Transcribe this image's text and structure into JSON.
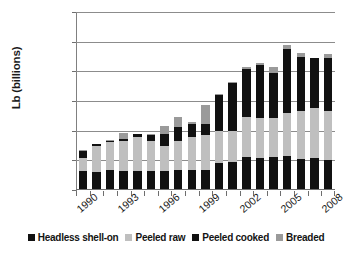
{
  "chart_data": {
    "type": "bar",
    "stacked": true,
    "title": "",
    "xlabel": "",
    "ylabel": "Lb (billions)",
    "ylim": [
      0,
      3
    ],
    "ytick_labels": [
      "0",
      "0.5",
      "1",
      "1.5",
      "2",
      "2.5",
      "3"
    ],
    "ytick_values": [
      0,
      0.5,
      1,
      1.5,
      2,
      2.5,
      3
    ],
    "grid": true,
    "legend_position": "bottom",
    "categories": [
      1990,
      1991,
      1992,
      1993,
      1994,
      1995,
      1996,
      1997,
      1998,
      1999,
      2000,
      2001,
      2002,
      2003,
      2004,
      2005,
      2006,
      2007,
      2008
    ],
    "xtick_labels_shown": [
      "1990",
      "1993",
      "1996",
      "1999",
      "2002",
      "2005",
      "2008"
    ],
    "xtick_label_interval": 3,
    "series": [
      {
        "name": "Headless shell-on",
        "color": "#111111",
        "values": [
          0.32,
          0.31,
          0.34,
          0.32,
          0.32,
          0.32,
          0.32,
          0.33,
          0.34,
          0.34,
          0.45,
          0.47,
          0.56,
          0.54,
          0.55,
          0.57,
          0.53,
          0.54,
          0.5
        ]
      },
      {
        "name": "Peeled raw",
        "color": "#bfbfbf",
        "values": [
          0.22,
          0.43,
          0.47,
          0.5,
          0.58,
          0.51,
          0.43,
          0.49,
          0.56,
          0.59,
          0.55,
          0.53,
          0.67,
          0.68,
          0.67,
          0.73,
          0.8,
          0.84,
          0.83
        ]
      },
      {
        "name": "Peeled cooked",
        "color": "#111111",
        "values": [
          0.11,
          0.03,
          0.02,
          0.04,
          0.05,
          0.09,
          0.19,
          0.25,
          0.22,
          0.18,
          0.61,
          0.81,
          0.81,
          0.89,
          0.76,
          1.07,
          0.91,
          0.84,
          0.9
        ]
      },
      {
        "name": "Breaded",
        "color": "#9a9a9a",
        "values": [
          0.02,
          0.01,
          0.01,
          0.1,
          0.0,
          0.02,
          0.14,
          0.16,
          0.02,
          0.33,
          0.01,
          0.01,
          0.03,
          0.03,
          0.1,
          0.08,
          0.07,
          0.0,
          0.07
        ]
      }
    ],
    "totals": [
      0.67,
      0.78,
      0.84,
      0.96,
      0.95,
      0.94,
      1.08,
      1.23,
      1.14,
      1.44,
      1.62,
      1.82,
      2.07,
      2.14,
      2.08,
      2.45,
      2.31,
      2.22,
      2.3
    ]
  },
  "legend": {
    "items": [
      {
        "label": "Headless shell-on",
        "color": "#111111"
      },
      {
        "label": "Peeled raw",
        "color": "#bfbfbf"
      },
      {
        "label": "Peeled cooked",
        "color": "#111111"
      },
      {
        "label": "Breaded",
        "color": "#9a9a9a"
      }
    ]
  }
}
